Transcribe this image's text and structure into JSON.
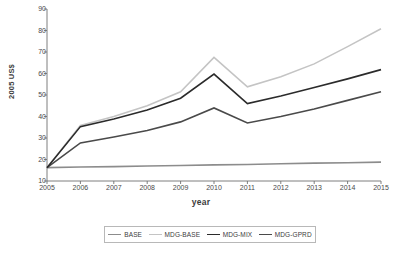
{
  "chart_data": {
    "type": "line",
    "title": "",
    "xlabel": "year",
    "ylabel": "2005 US$",
    "x": [
      2005,
      2006,
      2007,
      2008,
      2009,
      2010,
      2011,
      2012,
      2013,
      2014,
      2015
    ],
    "categories": [
      "2005",
      "2006",
      "2007",
      "2008",
      "2009",
      "2010",
      "2011",
      "2012",
      "2013",
      "2014",
      "2015"
    ],
    "xlim": [
      2005,
      2015
    ],
    "ylim": [
      10,
      90
    ],
    "yticks": [
      10,
      20,
      30,
      40,
      50,
      60,
      70,
      80,
      90
    ],
    "grid": false,
    "legend_position": "bottom",
    "series": [
      {
        "name": "BASE",
        "color": "#8c8c8c",
        "width": 1.6,
        "values": [
          16.2,
          16.5,
          16.7,
          17.0,
          17.2,
          17.5,
          17.7,
          18.0,
          18.3,
          18.5,
          18.8
        ]
      },
      {
        "name": "MDG-BASE",
        "color": "#c4c4c4",
        "width": 1.5,
        "values": [
          16.2,
          35.8,
          40.0,
          45.0,
          51.5,
          67.5,
          53.8,
          58.5,
          64.5,
          72.5,
          80.8
        ]
      },
      {
        "name": "MDG-MIX",
        "color": "#2b2b2b",
        "width": 1.6,
        "values": [
          16.2,
          35.3,
          38.8,
          43.0,
          48.5,
          59.7,
          46.0,
          49.5,
          53.5,
          57.5,
          61.8
        ]
      },
      {
        "name": "MDG-GPRD",
        "color": "#4a4a4a",
        "width": 1.6,
        "values": [
          16.2,
          27.7,
          30.5,
          33.5,
          37.5,
          44.0,
          37.0,
          40.0,
          43.5,
          47.5,
          51.5
        ]
      }
    ]
  },
  "legend": {
    "items": [
      {
        "label": "BASE"
      },
      {
        "label": "MDG-BASE"
      },
      {
        "label": "MDG-MIX"
      },
      {
        "label": "MDG-GPRD"
      }
    ]
  },
  "axes": {
    "y_title": "2005 US$",
    "x_title": "year"
  }
}
